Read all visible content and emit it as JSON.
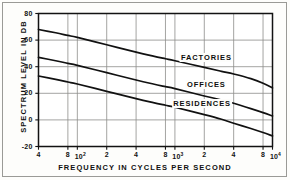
{
  "figure": {
    "background_color": "#fdfdfb",
    "frame_color": "#9a9a96",
    "axis_color": "#121212",
    "grid_color": "#8d8d8a",
    "curve_color": "#111111"
  },
  "chart_data": {
    "type": "line",
    "title": "",
    "xlabel": "FREQUENCY IN CYCLES PER SECOND",
    "ylabel": "SPECTRUM LEVEL IN DB",
    "xscale": "log",
    "xlim": [
      40,
      10000
    ],
    "ylim": [
      -20,
      80
    ],
    "grid": true,
    "legend_position": "inline-labels",
    "ytick_values": [
      80,
      60,
      40,
      20,
      0,
      -20
    ],
    "ytick_labels": [
      "80",
      "60",
      "40",
      "20",
      "0",
      "-20"
    ],
    "xtick_values": [
      40,
      80,
      100,
      200,
      400,
      800,
      1000,
      2000,
      4000,
      8000,
      10000
    ],
    "xtick_labels": [
      "4",
      "8",
      "10²",
      "2",
      "4",
      "8",
      "10³",
      "2",
      "4",
      "8",
      "10⁴"
    ],
    "xtick_mantissas": [
      "4",
      "8",
      "10",
      "2",
      "4",
      "8",
      "10",
      "2",
      "4",
      "8",
      "10"
    ],
    "xtick_exponents": [
      "",
      "",
      "2",
      "",
      "",
      "",
      "3",
      "",
      "",
      "",
      "4"
    ],
    "series": [
      {
        "name": "FACTORIES",
        "label_x_hz": 2100,
        "label_y_db": 47,
        "x": [
          40,
          60,
          80,
          100,
          200,
          400,
          600,
          800,
          1000,
          2000,
          3000,
          4000,
          6000,
          8000,
          10000
        ],
        "values": [
          68,
          65.5,
          63.5,
          62,
          56.5,
          51,
          48,
          46,
          44.5,
          39.5,
          36.5,
          34.5,
          31,
          27.5,
          24
        ]
      },
      {
        "name": "OFFICES",
        "label_x_hz": 2100,
        "label_y_db": 27,
        "x": [
          40,
          60,
          80,
          100,
          200,
          400,
          600,
          800,
          1000,
          2000,
          3000,
          4000,
          6000,
          8000,
          10000
        ],
        "values": [
          47,
          44.5,
          42.5,
          41,
          35.5,
          30,
          27,
          25,
          23.5,
          18,
          15,
          12.5,
          8.5,
          5.5,
          3
        ]
      },
      {
        "name": "RESIDENCES",
        "label_x_hz": 1900,
        "label_y_db": 13,
        "x": [
          40,
          60,
          80,
          100,
          200,
          400,
          600,
          800,
          1000,
          2000,
          3000,
          4000,
          6000,
          8000,
          10000
        ],
        "values": [
          33,
          30.5,
          28.5,
          27,
          21.5,
          16,
          13,
          11,
          9.5,
          4,
          0.5,
          -2.5,
          -6.5,
          -9.5,
          -12
        ]
      }
    ]
  }
}
